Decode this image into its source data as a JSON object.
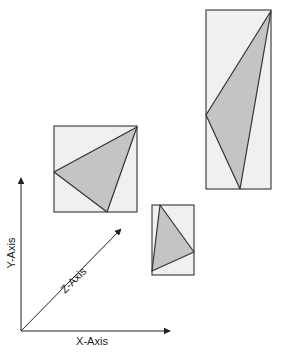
{
  "diagram": {
    "colors": {
      "box_fill": "#f0f0f0",
      "box_stroke": "#444444",
      "triangle_fill": "#c4c4c4",
      "triangle_stroke": "#333333",
      "axis": "#222222"
    },
    "axes": {
      "x_label": "X-Axis",
      "y_label": "Y-Axis",
      "z_label": "Z-Axis"
    },
    "boxes": [
      {
        "name": "large-square-view",
        "x": 54,
        "y": 126,
        "w": 83,
        "h": 86,
        "triangle": "137,127 54,172 107,212"
      },
      {
        "name": "small-view",
        "x": 152,
        "y": 205,
        "w": 42,
        "h": 70,
        "triangle": "160,205 194,252 152,271"
      },
      {
        "name": "tall-view",
        "x": 206,
        "y": 10,
        "w": 65,
        "h": 179,
        "triangle": "271,11 206,115 240,189"
      }
    ]
  }
}
